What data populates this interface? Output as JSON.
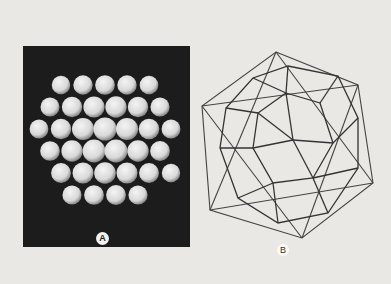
{
  "figure": {
    "panels": [
      {
        "id": "A",
        "label": "A",
        "description": "Photograph of a spherical virus capsid model composed of packed round subunits on a dark background"
      },
      {
        "id": "B",
        "label": "B",
        "description": "Wireframe icosahedron enclosing a geodesic polyhedron"
      }
    ]
  }
}
